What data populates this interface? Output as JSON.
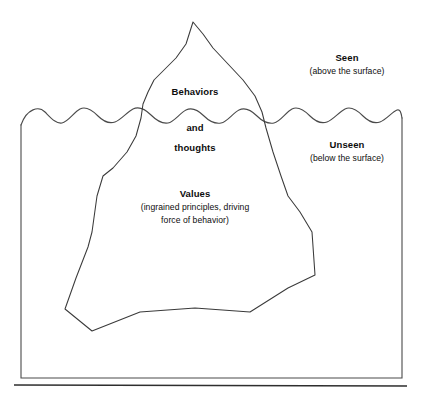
{
  "diagram": {
    "type": "iceberg-model",
    "background_color": "#ffffff",
    "line_color": "#3a3a3a",
    "text_color": "#0d0d0d",
    "labels": {
      "behaviors": "Behaviors",
      "and": "and",
      "thoughts": "thoughts",
      "values_title": "Values",
      "values_detail_line1": "(ingrained principles, driving",
      "values_detail_line2": "force of behavior)",
      "seen_title": "Seen",
      "seen_detail": "(above the surface)",
      "unseen_title": "Unseen",
      "unseen_detail": "(below the surface)"
    },
    "regions": [
      {
        "name": "above-water",
        "title": "Seen",
        "detail": "(above the surface)",
        "contains": [
          "Behaviors"
        ]
      },
      {
        "name": "below-water",
        "title": "Unseen",
        "detail": "(below the surface)",
        "contains": [
          "and",
          "thoughts",
          "Values"
        ]
      }
    ]
  }
}
